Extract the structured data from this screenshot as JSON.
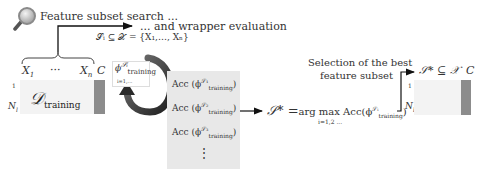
{
  "header": {
    "icon": "magnifier-icon",
    "search_label": "Feature subset search ...",
    "wrapper_label": "... and wrapper evaluation",
    "subset_def": "𝒮ᵢ ⊆ 𝒳 = {X₁,…, Xₙ}"
  },
  "training_table": {
    "col_first": "X",
    "col_first_sub": "1",
    "col_ellipsis": "···",
    "col_last": "X",
    "col_last_sub": "n",
    "col_class": "C",
    "row_first": "1",
    "row_last": "N",
    "row_last_sub": "l",
    "dataset_label": "𝒟",
    "dataset_sub": "training"
  },
  "model_box": {
    "phi": "ϕ",
    "phi_sup": "𝒮ᵢ",
    "phi_sub": "training",
    "index": "i=1,..."
  },
  "acc_list": {
    "items": [
      {
        "prefix": "Acc (ϕ",
        "sup": "𝒮₁",
        "sub": "training",
        "suffix": ")"
      },
      {
        "prefix": "Acc (ϕ",
        "sup": "𝒮₂",
        "sub": "training",
        "suffix": ")"
      },
      {
        "prefix": "Acc (ϕ",
        "sup": "𝒮₃",
        "sub": "training",
        "suffix": ")"
      }
    ],
    "more": "⋮"
  },
  "selection": {
    "title_line1": "Selection of the best",
    "title_line2": "feature subset",
    "formula_lhs": "𝒮* =",
    "formula_op": "arg max Acc(ϕ",
    "formula_sup": "𝒮ᵢ",
    "formula_sub": "training",
    "formula_close": ")",
    "formula_index": "i=1,2 ..."
  },
  "result_table": {
    "header": "𝒮* ⊆ 𝒳",
    "col_class": "C",
    "row_first": "1",
    "row_last": "N",
    "row_last_sub": "l"
  },
  "colors": {
    "class_column": "#8c8c8c",
    "row_fill": "#f3f3f3",
    "acc_fill": "#e8e8e8",
    "loop_arrow": "#2f2f2f"
  }
}
